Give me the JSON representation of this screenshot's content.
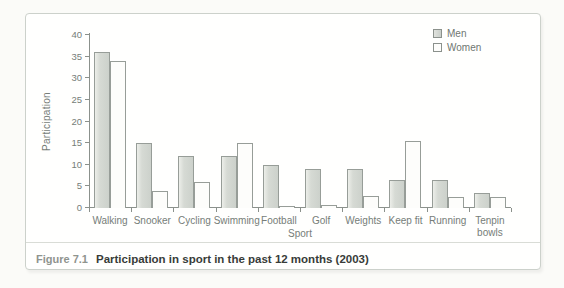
{
  "figure": {
    "caption_label": "Figure 7.1",
    "caption_text": "Participation in sport in the past 12 months (2003)"
  },
  "chart_data": {
    "type": "bar",
    "categories": [
      "Walking",
      "Snooker",
      "Cycling",
      "Swimming",
      "Football",
      "Golf",
      "Weights",
      "Keep fit",
      "Running",
      "Tenpin\nbowls"
    ],
    "series": [
      {
        "name": "Men",
        "values": [
          36,
          15,
          12,
          12,
          10,
          9,
          9,
          6.5,
          6.5,
          3.5
        ]
      },
      {
        "name": "Women",
        "values": [
          34,
          4,
          6,
          15,
          0.3,
          0.7,
          2.7,
          15.5,
          2.5,
          2.5
        ]
      }
    ],
    "xlabel": "Sport",
    "ylabel": "Participation",
    "ylim": [
      0,
      40
    ],
    "yticks": [
      0,
      5,
      10,
      15,
      20,
      25,
      30,
      35,
      40
    ],
    "grid": false,
    "legend_position": "top-right",
    "colors": {
      "men_fill": "#d6dad4",
      "women_fill": "#fdfdfb",
      "bar_border": "#979d98",
      "axis": "#8b918c",
      "label_text": "#767d78",
      "caption_label_text": "#8f948e",
      "caption_text": "#383c39",
      "box_border": "#ccd1cb"
    }
  }
}
